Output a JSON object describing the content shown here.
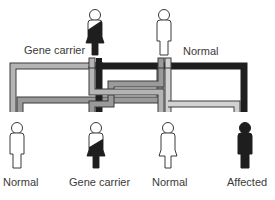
{
  "diagram": {
    "type": "inheritance-pedigree",
    "colors": {
      "normal_gene": "#9a9a9a",
      "normal_gene_light": "#cfcfcf",
      "defective_gene": "#1e1e1e",
      "outline": "#3a3a3a"
    },
    "parents": [
      {
        "id": "mother",
        "label": "Gene carrier",
        "status": "carrier",
        "sex": "female"
      },
      {
        "id": "father",
        "label": "Normal",
        "status": "normal",
        "sex": "male"
      }
    ],
    "children": [
      {
        "id": "child-1",
        "label": "Normal",
        "status": "normal",
        "sex": "male"
      },
      {
        "id": "child-2",
        "label": "Gene carrier",
        "status": "carrier",
        "sex": "female"
      },
      {
        "id": "child-3",
        "label": "Normal",
        "status": "normal",
        "sex": "female"
      },
      {
        "id": "child-4",
        "label": "Affected",
        "status": "affected",
        "sex": "male"
      }
    ]
  }
}
